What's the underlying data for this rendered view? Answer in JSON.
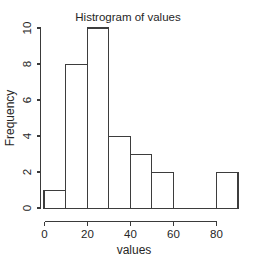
{
  "chart_data": {
    "type": "bar",
    "title": "Histrogram of values",
    "xlabel": "values",
    "ylabel": "Frequency",
    "bin_width": 10,
    "bin_edges": [
      0,
      10,
      20,
      30,
      40,
      50,
      60,
      70,
      80,
      90
    ],
    "categories": [
      "0-10",
      "10-20",
      "20-30",
      "30-40",
      "40-50",
      "50-60",
      "60-70",
      "70-80",
      "80-90"
    ],
    "values": [
      1,
      8,
      10,
      4,
      3,
      2,
      0,
      0,
      2
    ],
    "xlim": [
      0,
      90
    ],
    "ylim": [
      0,
      10
    ],
    "xticks": [
      0,
      20,
      40,
      60,
      80
    ],
    "xtick_labels": [
      "0",
      "20",
      "40",
      "60",
      "80"
    ],
    "yticks": [
      0,
      2,
      4,
      6,
      8,
      10
    ],
    "ytick_labels": [
      "0",
      "2",
      "4",
      "6",
      "8",
      "10"
    ],
    "grid": false,
    "legend": false,
    "bar_fill_color": "#ffffff",
    "bar_border_color": "#3d3d3d",
    "axis_color": "#3a3a3a",
    "background_color": "#ffffff"
  },
  "labels": {
    "title": "Histrogram of values",
    "x_axis_title": "values",
    "y_axis_title": "Frequency",
    "xtick_0": "0",
    "xtick_1": "20",
    "xtick_2": "40",
    "xtick_3": "60",
    "xtick_4": "80",
    "ytick_0": "0",
    "ytick_1": "2",
    "ytick_2": "4",
    "ytick_3": "6",
    "ytick_4": "8",
    "ytick_5": "10"
  }
}
